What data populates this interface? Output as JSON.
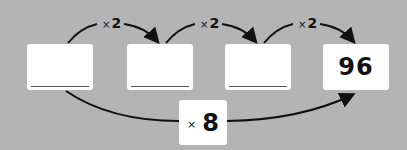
{
  "boxes": [
    {
      "value": "",
      "placeholder": "blank"
    },
    {
      "value": "",
      "placeholder": "blank"
    },
    {
      "value": "",
      "placeholder": "blank"
    },
    {
      "value": "96"
    }
  ],
  "step_labels": [
    {
      "symbol": "×",
      "factor": "2"
    },
    {
      "symbol": "×",
      "factor": "2"
    },
    {
      "symbol": "×",
      "factor": "2"
    }
  ],
  "overall": {
    "symbol": "×",
    "factor": "8"
  },
  "colors": {
    "background": "#b4b4b4",
    "box": "#ffffff",
    "arrow": "#111111"
  }
}
